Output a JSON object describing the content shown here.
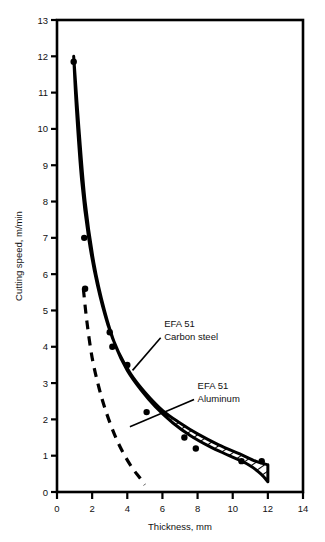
{
  "chart_data": {
    "type": "line",
    "title": "",
    "xlabel": "Thickness, mm",
    "ylabel": "Cutting speed, m/min",
    "xlim": [
      0,
      14
    ],
    "ylim": [
      0,
      13
    ],
    "grid": false,
    "legend_position": "inline-annotations",
    "xticks": [
      "0",
      "2",
      "4",
      "6",
      "8",
      "10",
      "12",
      "14"
    ],
    "xtick_values": [
      0,
      2,
      4,
      6,
      8,
      10,
      12,
      14
    ],
    "yticks": [
      "0",
      "1",
      "2",
      "3",
      "4",
      "5",
      "6",
      "7",
      "8",
      "9",
      "10",
      "11",
      "12",
      "13"
    ],
    "ytick_values": [
      0,
      1,
      2,
      3,
      4,
      5,
      6,
      7,
      8,
      9,
      10,
      11,
      12,
      13
    ],
    "series": [
      {
        "name": "EFA 51 Carbon steel",
        "style": "hatched-band",
        "upper_x": [
          0.95,
          1.1,
          1.4,
          1.8,
          2.3,
          2.9,
          3.5,
          4.2,
          5.0,
          6.0,
          7.0,
          8.0,
          9.2,
          10.4,
          11.3,
          12.0
        ],
        "upper_y": [
          12.0,
          10.6,
          8.6,
          7.0,
          5.7,
          4.6,
          3.85,
          3.25,
          2.75,
          2.25,
          1.9,
          1.6,
          1.3,
          1.05,
          0.85,
          0.75
        ],
        "lower_x": [
          0.95,
          1.25,
          1.6,
          2.1,
          2.7,
          3.35,
          4.0,
          4.8,
          5.6,
          6.6,
          7.6,
          8.7,
          9.8,
          10.9,
          11.6,
          12.0
        ],
        "lower_y": [
          12.0,
          10.0,
          8.0,
          6.3,
          5.0,
          4.0,
          3.35,
          2.8,
          2.35,
          1.9,
          1.55,
          1.25,
          1.0,
          0.75,
          0.5,
          0.28
        ],
        "data_points": [
          {
            "x": 0.95,
            "y": 11.85
          },
          {
            "x": 1.55,
            "y": 7.0
          },
          {
            "x": 1.6,
            "y": 5.6
          },
          {
            "x": 3.0,
            "y": 4.4
          },
          {
            "x": 3.15,
            "y": 4.0
          },
          {
            "x": 4.0,
            "y": 3.5
          },
          {
            "x": 5.1,
            "y": 2.2
          },
          {
            "x": 7.25,
            "y": 1.5
          },
          {
            "x": 7.9,
            "y": 1.2
          },
          {
            "x": 10.5,
            "y": 0.85
          },
          {
            "x": 11.65,
            "y": 0.85
          }
        ]
      },
      {
        "name": "EFA 51 Aluminum",
        "style": "dashed",
        "x": [
          1.5,
          1.7,
          2.0,
          2.4,
          2.8,
          3.3,
          3.8,
          4.3,
          4.7,
          5.0
        ],
        "y": [
          5.6,
          4.7,
          3.7,
          2.85,
          2.2,
          1.55,
          1.05,
          0.65,
          0.4,
          0.2
        ]
      }
    ],
    "annotations": [
      {
        "id": "carbon-steel",
        "line1": "EFA 51",
        "line2": "Carbon steel",
        "text_x": 6.1,
        "text_y": 4.55,
        "leader_from_x": 5.9,
        "leader_from_y": 4.25,
        "leader_to_x": 4.3,
        "leader_to_y": 3.35
      },
      {
        "id": "aluminum",
        "line1": "EFA 51",
        "line2": "Aluminum",
        "text_x": 8.0,
        "text_y": 2.85,
        "leader_from_x": 7.8,
        "leader_from_y": 2.55,
        "leader_to_x": 4.15,
        "leader_to_y": 1.8
      }
    ]
  },
  "style": {
    "line_color": "#000000",
    "background": "#ffffff",
    "hatch_color": "#000000"
  }
}
